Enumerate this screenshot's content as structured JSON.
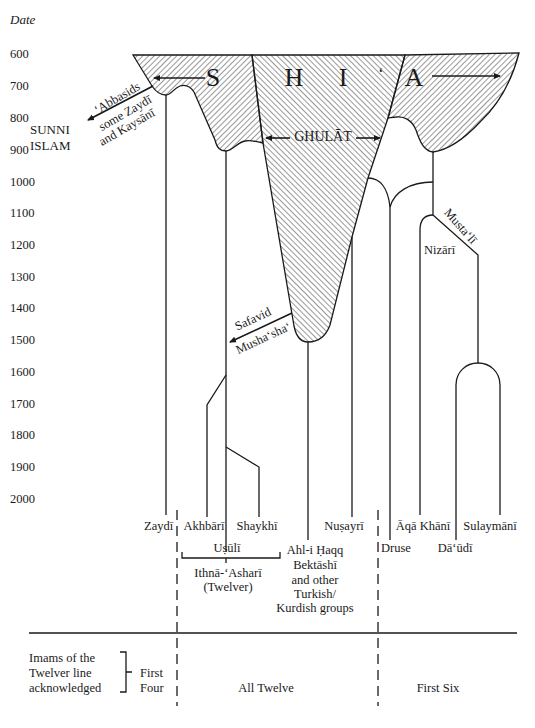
{
  "axis": {
    "title": "Date",
    "ticks": [
      {
        "label": "600",
        "y": 54
      },
      {
        "label": "700",
        "y": 86
      },
      {
        "label": "800",
        "y": 118
      },
      {
        "label": "900",
        "y": 150
      },
      {
        "label": "1000",
        "y": 182
      },
      {
        "label": "1100",
        "y": 213
      },
      {
        "label": "1200",
        "y": 245
      },
      {
        "label": "1300",
        "y": 277
      },
      {
        "label": "1400",
        "y": 308
      },
      {
        "label": "1500",
        "y": 340
      },
      {
        "label": "1600",
        "y": 372
      },
      {
        "label": "1700",
        "y": 404
      },
      {
        "label": "1800",
        "y": 435
      },
      {
        "label": "1900",
        "y": 467
      },
      {
        "label": "2000",
        "y": 499
      }
    ]
  },
  "header_letters": [
    "S",
    "H",
    "I",
    "‘",
    "A"
  ],
  "regions": {
    "ghulat": "GHULĀT",
    "sunni": [
      "SUNNI",
      "ISLAM"
    ],
    "abbasid_branch": [
      "‘Abbasids",
      "some Zaydī",
      "and Kaysānī"
    ],
    "safavid": "Safavid",
    "mushasha": "Musha‘sha‘",
    "mustali": "Musta‘lī",
    "nizari": "Nizārī"
  },
  "branches": {
    "zaydi": "Zaydī",
    "akhbari": "Akhbārī",
    "shaykhi": "Shaykhī",
    "usuli": "Uṣūlī",
    "twelver": [
      "Ithnā-‘Asharī",
      "(Twelver)"
    ],
    "ahl_i_haqq": [
      "Ahl-i Ḥaqq",
      "Bektāshī",
      "and other",
      "Turkish/",
      "Kurdish groups"
    ],
    "nusayri": "Nuṣayrī",
    "druse": "Druse",
    "aqa_khani": "Āqā Khānī",
    "daudi": "Dā‘ūdī",
    "sulaymani": "Sulaymānī"
  },
  "imams": {
    "row_label": [
      "Imams of the",
      "Twelver line",
      "acknowledged"
    ],
    "first_four": [
      "First",
      "Four"
    ],
    "all_twelve": "All Twelve",
    "first_six": "First Six"
  },
  "colors": {
    "ink": "#1a1a1a",
    "background": "#ffffff"
  }
}
